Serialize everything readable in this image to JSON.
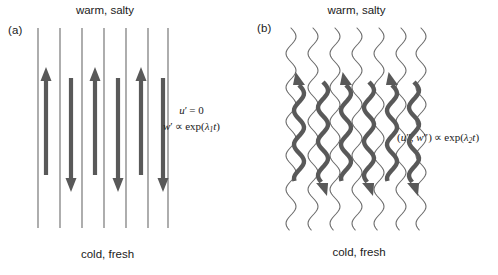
{
  "figure": {
    "panels": [
      {
        "id": "a",
        "label": "(a)",
        "top_label": "warm, salty",
        "bottom_label": "cold, fresh",
        "line_style": "straight",
        "equations": {
          "line1_lhs": "u",
          "line1_prime": "′",
          "line1_rhs": "= 0",
          "line2_lhs": "w",
          "line2_prime": "′",
          "line2_prop": "∝",
          "line2_exp": "exp(",
          "line2_lambda": "λ",
          "line2_sub": "1",
          "line2_t": "t",
          "line2_close": ")"
        },
        "vertical_lines": [
          {
            "x": 38
          },
          {
            "x": 60
          },
          {
            "x": 82
          },
          {
            "x": 104
          },
          {
            "x": 126
          },
          {
            "x": 148
          },
          {
            "x": 168
          }
        ],
        "line_top": 28,
        "line_bottom": 228,
        "arrows": [
          {
            "x": 46,
            "direction": "up",
            "top": 67,
            "bottom": 175
          },
          {
            "x": 71,
            "direction": "down",
            "top": 78,
            "bottom": 192
          },
          {
            "x": 95,
            "direction": "up",
            "top": 67,
            "bottom": 175
          },
          {
            "x": 118,
            "direction": "down",
            "top": 78,
            "bottom": 192
          },
          {
            "x": 141,
            "direction": "up",
            "top": 67,
            "bottom": 175
          },
          {
            "x": 163,
            "direction": "down",
            "top": 78,
            "bottom": 192
          }
        ]
      },
      {
        "id": "b",
        "label": "(b)",
        "top_label": "warm, salty",
        "bottom_label": "cold, fresh",
        "line_style": "wavy",
        "equations": {
          "lhs_open": "(",
          "lhs_u": "u",
          "lhs_u_prime": "″",
          "lhs_comma": ", ",
          "lhs_w": "w",
          "lhs_w_prime": "″",
          "lhs_close": ")",
          "prop": "∝",
          "exp": "exp(",
          "lambda": "λ",
          "sub": "2",
          "t": "t",
          "close": ")"
        },
        "wavy_lines": [
          {
            "x": 42
          },
          {
            "x": 64
          },
          {
            "x": 86
          },
          {
            "x": 108
          },
          {
            "x": 130
          },
          {
            "x": 152
          },
          {
            "x": 172
          }
        ],
        "line_top": 28,
        "line_bottom": 230,
        "wave_amplitude": 5,
        "wave_period": 34,
        "arrows": [
          {
            "x": 50,
            "direction": "up",
            "top": 72,
            "bottom": 182
          },
          {
            "x": 74,
            "direction": "down",
            "top": 82,
            "bottom": 196
          },
          {
            "x": 97,
            "direction": "up",
            "top": 72,
            "bottom": 182
          },
          {
            "x": 120,
            "direction": "down",
            "top": 82,
            "bottom": 196
          },
          {
            "x": 143,
            "direction": "up",
            "top": 72,
            "bottom": 182
          },
          {
            "x": 165,
            "direction": "down",
            "top": 82,
            "bottom": 196
          }
        ]
      }
    ],
    "colors": {
      "arrow": "#595959",
      "line": "#6b6b6b",
      "text": "#1a1a1a",
      "background": "#ffffff"
    }
  }
}
